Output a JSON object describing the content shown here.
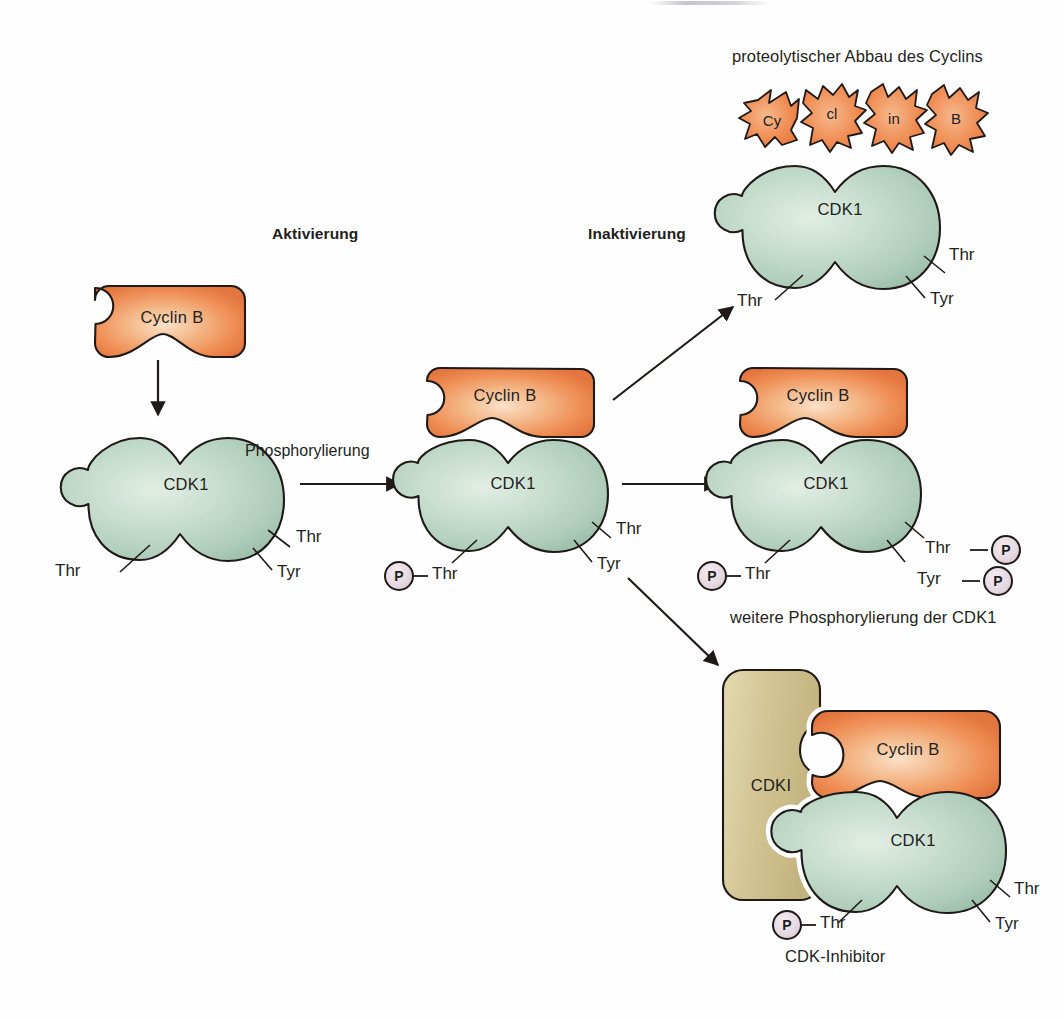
{
  "diagram": {
    "language": "de"
  },
  "colors": {
    "cyclin_fill_light": "#f6c9a4",
    "cyclin_fill_mid": "#ef8b51",
    "cyclin_fill_edge": "#e2743c",
    "cdk_fill_light": "#d6e6da",
    "cdk_fill_mid": "#b5d2bf",
    "cdk_fill_edge": "#9cc0ab",
    "cdki_fill_light": "#e0d6a8",
    "cdki_fill_mid": "#cfc08e",
    "cdki_fill_edge": "#bfae76",
    "phosphate_fill": "#e7dbe2",
    "outline": "#1f1a17",
    "text": "#231f20"
  },
  "sections": {
    "activation_label": "Aktivierung",
    "inactivation_label": "Inaktivierung"
  },
  "arrow_labels": {
    "phosphorylation": "Phosphorylierung"
  },
  "captions": {
    "proteolysis": "proteolytischer Abbau des Cyclins",
    "further_phosphorylation": "weitere Phosphorylierung der CDK1",
    "cdk_inhibitor": "CDK-Inhibitor"
  },
  "protein_labels": {
    "cyclin_b": "Cyclin B",
    "cdk1": "CDK1",
    "cdki": "CDKI"
  },
  "residues": {
    "thr": "Thr",
    "tyr": "Tyr"
  },
  "phosphate": {
    "symbol": "P"
  },
  "cyclin_fragments": [
    {
      "text": "Cy"
    },
    {
      "text": "cl"
    },
    {
      "text": "in"
    },
    {
      "text": "B"
    }
  ],
  "nodes": {
    "free_cyclin": {
      "name": "Cyclin B (frei)",
      "label": "Cyclin B"
    },
    "free_cdk1": {
      "name": "CDK1 (unphosphoryliert)",
      "label": "CDK1",
      "residues": [
        "Thr",
        "Thr",
        "Tyr"
      ]
    },
    "active_complex": {
      "name": "Cyclin B / CDK1 Komplex, Thr phosphoryliert",
      "cyclin_label": "Cyclin B",
      "cdk_label": "CDK1",
      "residues": [
        "Thr",
        "Thr",
        "Tyr"
      ],
      "phosphates": 1
    },
    "degraded_cyclin": {
      "name": "CDK1 nach proteolytischem Abbau des Cyclins",
      "cdk_label": "CDK1",
      "residues": [
        "Thr",
        "Thr",
        "Tyr"
      ],
      "fragments": [
        "Cy",
        "cl",
        "in",
        "B"
      ]
    },
    "hyperphosphorylated": {
      "name": "Cyclin B / CDK1 mit Thr-P und Tyr-P",
      "cyclin_label": "Cyclin B",
      "cdk_label": "CDK1",
      "residues": [
        "Thr",
        "Thr",
        "Tyr"
      ],
      "phosphates": 3
    },
    "inhibited": {
      "name": "CDKI gebunden an Cyclin B / CDK1",
      "cdki_label": "CDKI",
      "cyclin_label": "Cyclin B",
      "cdk_label": "CDK1",
      "residues": [
        "Thr",
        "Thr",
        "Tyr"
      ],
      "phosphates": 1
    }
  }
}
